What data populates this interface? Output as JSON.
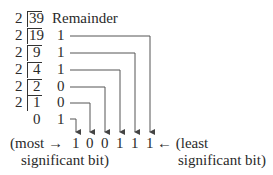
{
  "header": {
    "remainder_label": "Remainder"
  },
  "divisions": [
    {
      "divisor": "2",
      "dividend": "39",
      "remainder": ""
    },
    {
      "divisor": "2",
      "dividend": "19",
      "remainder": "1"
    },
    {
      "divisor": "2",
      "dividend": "9",
      "remainder": "1"
    },
    {
      "divisor": "2",
      "dividend": "4",
      "remainder": "1"
    },
    {
      "divisor": "2",
      "dividend": "2",
      "remainder": "0"
    },
    {
      "divisor": "2",
      "dividend": "1",
      "remainder": "0"
    },
    {
      "divisor": "",
      "dividend": "0",
      "remainder": "1"
    }
  ],
  "result_bits": [
    "1",
    "0",
    "0",
    "1",
    "1",
    "1"
  ],
  "labels": {
    "msb_line1": "(most →",
    "msb_line2": "significant bit)",
    "lsb_line1": "← (least",
    "lsb_line2": "significant bit)"
  },
  "colors": {
    "ink": "#2a2a2a",
    "line": "#444444"
  }
}
